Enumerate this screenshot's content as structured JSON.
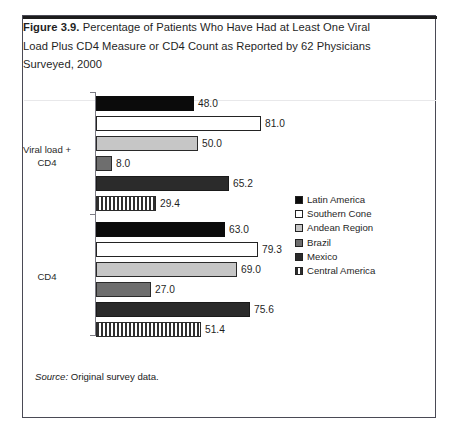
{
  "figure": {
    "label": "Figure 3.9.",
    "caption": " Percentage of Patients Who Have Had at Least One Viral Load Plus CD4 Measure or CD4 Count as Reported by 62 Physicians Surveyed, 2000",
    "source_word": "Source:",
    "source_text": " Original survey data."
  },
  "chart_data": {
    "type": "bar",
    "orientation": "horizontal",
    "title": "Percentage of Patients Who Have Had at Least One Viral Load Plus CD4 Measure or CD4 Count as Reported by 62 Physicians Surveyed, 2000",
    "xlabel": "",
    "ylabel": "",
    "xlim": [
      0,
      100
    ],
    "grid": false,
    "legend_position": "right",
    "categories": [
      "Viral load + CD4",
      "CD4"
    ],
    "series": [
      {
        "name": "Latin America",
        "color": "#0b0b0b",
        "fill": "solid",
        "values": [
          48.0,
          63.0
        ],
        "labels": [
          "48.0",
          "63.0"
        ]
      },
      {
        "name": "Southern Cone",
        "color": "#ffffff",
        "fill": "outline",
        "values": [
          81.0,
          79.3
        ],
        "labels": [
          "81.0",
          "79.3"
        ]
      },
      {
        "name": "Andean Region",
        "color": "#c6c6c6",
        "fill": "solid",
        "values": [
          50.0,
          69.0
        ],
        "labels": [
          "50.0",
          "69.0"
        ]
      },
      {
        "name": "Brazil",
        "color": "#6e6e6e",
        "fill": "solid",
        "values": [
          8.0,
          27.0
        ],
        "labels": [
          "8.0",
          "27.0"
        ]
      },
      {
        "name": "Mexico",
        "color": "#2b2b2b",
        "fill": "solid",
        "values": [
          65.2,
          75.6
        ],
        "labels": [
          "65.2",
          "75.6"
        ]
      },
      {
        "name": "Central America",
        "color": "#2f2f2f",
        "fill": "vertical-stripes",
        "values": [
          29.4,
          51.4
        ],
        "labels": [
          "29.4",
          "51.4"
        ]
      }
    ]
  },
  "legend": {
    "items": [
      {
        "label": "Latin America",
        "swatch": "swatch-latin-america"
      },
      {
        "label": "Southern Cone",
        "swatch": "swatch-southern-cone"
      },
      {
        "label": "Andean Region",
        "swatch": "swatch-andean-region"
      },
      {
        "label": "Brazil",
        "swatch": "swatch-brazil"
      },
      {
        "label": "Mexico",
        "swatch": "swatch-mexico"
      },
      {
        "label": "Central America",
        "swatch": "swatch-central-america"
      }
    ]
  },
  "group_labels": {
    "viral_line1": "Viral load +",
    "viral_line2": "CD4",
    "cd4": "CD4"
  }
}
